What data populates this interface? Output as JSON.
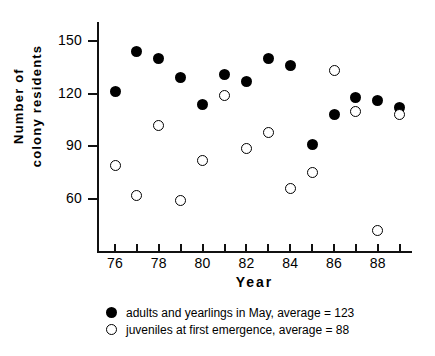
{
  "chart_data": {
    "type": "scatter",
    "title": "",
    "xlabel": "Year",
    "ylabel": "Number of colony residents",
    "ylabel_lines": [
      "Number  of",
      "colony  residents"
    ],
    "xlim": [
      75.3,
      89.7
    ],
    "ylim": [
      30,
      158
    ],
    "grid": false,
    "legend_position": "below-axes",
    "yticks": [
      150,
      120,
      90,
      60
    ],
    "xticks": [
      76,
      77,
      78,
      79,
      80,
      81,
      82,
      83,
      84,
      85,
      86,
      87,
      88,
      89
    ],
    "xtick_labels": [
      "76",
      "",
      "78",
      "",
      "80",
      "",
      "82",
      "",
      "84",
      "",
      "86",
      "",
      "88",
      ""
    ],
    "x": [
      76,
      77,
      78,
      79,
      80,
      81,
      82,
      83,
      84,
      85,
      86,
      87,
      88,
      89
    ],
    "series": [
      {
        "name": "adults and yearlings in May, average = 123",
        "marker": "filled-circle",
        "color": "#000000",
        "average": 123,
        "values": [
          121,
          144,
          140,
          129,
          114,
          131,
          127,
          140,
          136,
          91,
          108,
          118,
          116,
          112
        ]
      },
      {
        "name": "juveniles at first emergence, average = 88",
        "marker": "open-circle",
        "color": "#000000",
        "average": 88,
        "values": [
          79,
          62,
          102,
          59,
          82,
          119,
          89,
          98,
          66,
          75,
          133,
          110,
          42,
          108
        ]
      }
    ]
  },
  "legend": [
    {
      "marker": "filled-circle",
      "label": "adults and yearlings in May, average = 123"
    },
    {
      "marker": "open-circle",
      "label": "juveniles at first emergence, average = 88"
    }
  ]
}
